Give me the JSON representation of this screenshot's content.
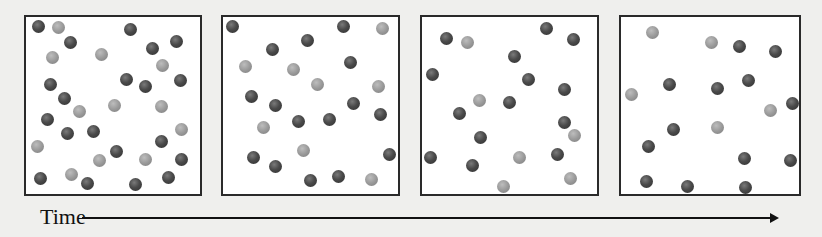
{
  "figure": {
    "axis_label": "Time",
    "colors": {
      "dark_particle": "#4a4a4a",
      "light_particle": "#9a9a9a",
      "border": "#2a2a2a",
      "background": "#efefed"
    },
    "panels": [
      {
        "id": "t1",
        "left": 24,
        "width": 178,
        "dark": [
          [
            38,
            26
          ],
          [
            70,
            42
          ],
          [
            130,
            29
          ],
          [
            152,
            48
          ],
          [
            176,
            41
          ],
          [
            50,
            84
          ],
          [
            126,
            79
          ],
          [
            145,
            86
          ],
          [
            180,
            80
          ],
          [
            64,
            98
          ],
          [
            47,
            119
          ],
          [
            67,
            133
          ],
          [
            93,
            131
          ],
          [
            116,
            151
          ],
          [
            161,
            141
          ],
          [
            181,
            159
          ],
          [
            40,
            178
          ],
          [
            87,
            183
          ],
          [
            135,
            184
          ],
          [
            168,
            177
          ]
        ],
        "light": [
          [
            58,
            27
          ],
          [
            52,
            57
          ],
          [
            101,
            54
          ],
          [
            162,
            65
          ],
          [
            79,
            111
          ],
          [
            114,
            105
          ],
          [
            161,
            106
          ],
          [
            181,
            129
          ],
          [
            37,
            146
          ],
          [
            99,
            160
          ],
          [
            145,
            159
          ],
          [
            71,
            174
          ]
        ]
      },
      {
        "id": "t2",
        "left": 221,
        "width": 179,
        "dark": [
          [
            232,
            26
          ],
          [
            272,
            49
          ],
          [
            307,
            40
          ],
          [
            343,
            26
          ],
          [
            350,
            62
          ],
          [
            251,
            96
          ],
          [
            275,
            105
          ],
          [
            298,
            121
          ],
          [
            329,
            119
          ],
          [
            380,
            114
          ],
          [
            353,
            103
          ],
          [
            389,
            154
          ],
          [
            253,
            157
          ],
          [
            275,
            166
          ],
          [
            310,
            180
          ],
          [
            338,
            176
          ]
        ],
        "light": [
          [
            245,
            66
          ],
          [
            293,
            69
          ],
          [
            317,
            84
          ],
          [
            378,
            86
          ],
          [
            382,
            28
          ],
          [
            263,
            127
          ],
          [
            303,
            150
          ],
          [
            371,
            179
          ]
        ]
      },
      {
        "id": "t3",
        "left": 420,
        "width": 179,
        "dark": [
          [
            446,
            38
          ],
          [
            546,
            28
          ],
          [
            573,
            39
          ],
          [
            514,
            56
          ],
          [
            432,
            74
          ],
          [
            528,
            79
          ],
          [
            564,
            89
          ],
          [
            509,
            102
          ],
          [
            459,
            113
          ],
          [
            564,
            122
          ],
          [
            480,
            137
          ],
          [
            430,
            157
          ],
          [
            472,
            165
          ],
          [
            557,
            154
          ]
        ],
        "light": [
          [
            467,
            42
          ],
          [
            479,
            100
          ],
          [
            574,
            135
          ],
          [
            519,
            157
          ],
          [
            503,
            186
          ],
          [
            570,
            178
          ]
        ]
      },
      {
        "id": "t4",
        "left": 619,
        "width": 182,
        "dark": [
          [
            739,
            46
          ],
          [
            775,
            51
          ],
          [
            669,
            84
          ],
          [
            717,
            88
          ],
          [
            748,
            80
          ],
          [
            792,
            103
          ],
          [
            673,
            129
          ],
          [
            648,
            146
          ],
          [
            744,
            158
          ],
          [
            790,
            160
          ],
          [
            646,
            181
          ],
          [
            687,
            186
          ],
          [
            745,
            187
          ]
        ],
        "light": [
          [
            652,
            32
          ],
          [
            711,
            42
          ],
          [
            631,
            94
          ],
          [
            770,
            110
          ],
          [
            717,
            127
          ]
        ]
      }
    ]
  }
}
